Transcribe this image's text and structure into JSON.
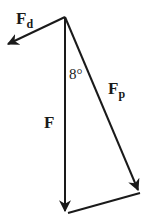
{
  "diagram": {
    "type": "force-vector-triangle",
    "colors": {
      "stroke": "#1a1a1a",
      "background": "#ffffff"
    },
    "vectors": [
      {
        "id": "Fd",
        "label_main": "F",
        "label_sub": "d",
        "from": [
          65,
          17
        ],
        "to": [
          5,
          45
        ]
      },
      {
        "id": "F",
        "label_main": "F",
        "label_sub": "",
        "from": [
          65,
          17
        ],
        "to": [
          65,
          213
        ]
      },
      {
        "id": "Fp",
        "label_main": "F",
        "label_sub": "p",
        "from": [
          65,
          17
        ],
        "to": [
          140,
          193
        ]
      }
    ],
    "closing_segment": {
      "from": [
        140,
        193
      ],
      "to": [
        68,
        213
      ]
    },
    "angle": {
      "label": "8°",
      "between": [
        "F",
        "Fp"
      ]
    }
  }
}
